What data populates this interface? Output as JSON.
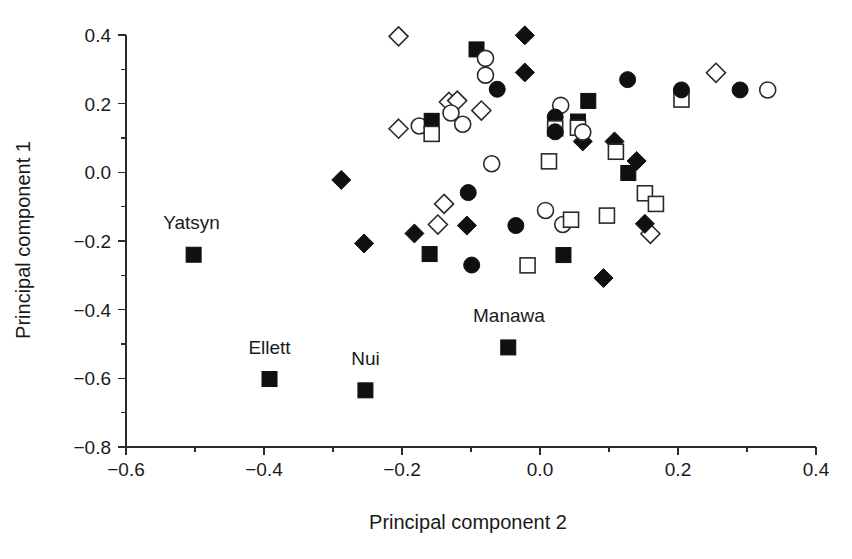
{
  "chart_data": {
    "type": "scatter",
    "title": "",
    "xlabel": "Principal component 2",
    "ylabel": "Principal component 1",
    "xlim": [
      -0.6,
      0.4
    ],
    "ylim": [
      -0.8,
      0.4
    ],
    "xticks": [
      -0.6,
      -0.4,
      -0.2,
      0.0,
      0.2,
      0.4
    ],
    "xticklabels": [
      "−0.6",
      "−0.4",
      "−0.2",
      "0.0",
      "0.2",
      "0.4"
    ],
    "xminorticks": [
      -0.5,
      -0.3,
      -0.1,
      0.1,
      0.3
    ],
    "yticks": [
      -0.8,
      -0.6,
      -0.4,
      -0.2,
      0.0,
      0.2,
      0.4
    ],
    "yticklabels": [
      "−0.8",
      "−0.6",
      "−0.4",
      "−0.2",
      "0.0",
      "0.2",
      "0.4"
    ],
    "yminorticks": [
      -0.7,
      -0.5,
      -0.3,
      -0.1,
      0.1,
      0.3
    ],
    "grid": false,
    "legend": "none",
    "marker_styles": {
      "filled-square": "solid black square",
      "open-square": "white square with black outline",
      "filled-circle": "solid black circle",
      "open-circle": "white circle with black outline",
      "filled-diamond": "solid black diamond",
      "open-diamond": "white diamond with black outline"
    },
    "annotations": [
      {
        "text": "Yatsyn",
        "x": -0.505,
        "y": -0.165
      },
      {
        "text": "Ellett",
        "x": -0.392,
        "y": -0.528
      },
      {
        "text": "Nui",
        "x": -0.253,
        "y": -0.562
      },
      {
        "text": "Manawa",
        "x": -0.045,
        "y": -0.437
      }
    ],
    "points": [
      {
        "x": -0.502,
        "y": -0.24,
        "marker": "filled-square",
        "label": "Yatsyn"
      },
      {
        "x": -0.392,
        "y": -0.602,
        "marker": "filled-square",
        "label": "Ellett"
      },
      {
        "x": -0.253,
        "y": -0.635,
        "marker": "filled-square",
        "label": "Nui"
      },
      {
        "x": -0.046,
        "y": -0.51,
        "marker": "filled-square",
        "label": "Manawa"
      },
      {
        "x": -0.288,
        "y": -0.022,
        "marker": "filled-diamond"
      },
      {
        "x": -0.255,
        "y": -0.207,
        "marker": "filled-diamond"
      },
      {
        "x": -0.182,
        "y": -0.178,
        "marker": "filled-diamond"
      },
      {
        "x": -0.16,
        "y": -0.238,
        "marker": "filled-square"
      },
      {
        "x": -0.148,
        "y": -0.152,
        "marker": "open-diamond"
      },
      {
        "x": -0.139,
        "y": -0.092,
        "marker": "open-diamond"
      },
      {
        "x": -0.104,
        "y": -0.059,
        "marker": "filled-circle"
      },
      {
        "x": -0.099,
        "y": -0.27,
        "marker": "filled-circle"
      },
      {
        "x": -0.106,
        "y": -0.155,
        "marker": "filled-diamond"
      },
      {
        "x": -0.205,
        "y": 0.396,
        "marker": "open-diamond"
      },
      {
        "x": -0.205,
        "y": 0.127,
        "marker": "open-diamond"
      },
      {
        "x": -0.175,
        "y": 0.135,
        "marker": "open-circle"
      },
      {
        "x": -0.157,
        "y": 0.15,
        "marker": "filled-square"
      },
      {
        "x": -0.157,
        "y": 0.112,
        "marker": "open-square"
      },
      {
        "x": -0.132,
        "y": 0.205,
        "marker": "open-diamond"
      },
      {
        "x": -0.12,
        "y": 0.209,
        "marker": "open-diamond"
      },
      {
        "x": -0.129,
        "y": 0.173,
        "marker": "open-circle"
      },
      {
        "x": -0.112,
        "y": 0.14,
        "marker": "open-circle"
      },
      {
        "x": -0.092,
        "y": 0.358,
        "marker": "filled-square"
      },
      {
        "x": -0.079,
        "y": 0.332,
        "marker": "open-circle"
      },
      {
        "x": -0.079,
        "y": 0.283,
        "marker": "open-circle"
      },
      {
        "x": -0.085,
        "y": 0.18,
        "marker": "open-diamond"
      },
      {
        "x": -0.07,
        "y": 0.025,
        "marker": "open-circle"
      },
      {
        "x": -0.062,
        "y": 0.242,
        "marker": "filled-circle"
      },
      {
        "x": -0.022,
        "y": 0.399,
        "marker": "filled-diamond"
      },
      {
        "x": -0.022,
        "y": 0.291,
        "marker": "filled-diamond"
      },
      {
        "x": -0.035,
        "y": -0.155,
        "marker": "filled-circle"
      },
      {
        "x": -0.018,
        "y": -0.271,
        "marker": "open-square"
      },
      {
        "x": 0.008,
        "y": -0.111,
        "marker": "open-circle"
      },
      {
        "x": 0.013,
        "y": 0.032,
        "marker": "open-square"
      },
      {
        "x": 0.03,
        "y": 0.195,
        "marker": "open-circle"
      },
      {
        "x": 0.022,
        "y": 0.161,
        "marker": "filled-circle"
      },
      {
        "x": 0.055,
        "y": 0.148,
        "marker": "filled-square"
      },
      {
        "x": 0.022,
        "y": 0.128,
        "marker": "open-square"
      },
      {
        "x": 0.055,
        "y": 0.13,
        "marker": "open-square"
      },
      {
        "x": 0.022,
        "y": 0.118,
        "marker": "filled-circle"
      },
      {
        "x": 0.062,
        "y": 0.09,
        "marker": "filled-diamond"
      },
      {
        "x": 0.062,
        "y": 0.117,
        "marker": "open-circle"
      },
      {
        "x": 0.033,
        "y": -0.152,
        "marker": "open-circle"
      },
      {
        "x": 0.045,
        "y": -0.138,
        "marker": "open-square"
      },
      {
        "x": 0.034,
        "y": -0.241,
        "marker": "filled-square"
      },
      {
        "x": 0.097,
        "y": -0.126,
        "marker": "open-square"
      },
      {
        "x": 0.108,
        "y": 0.09,
        "marker": "filled-diamond"
      },
      {
        "x": 0.11,
        "y": 0.06,
        "marker": "open-square"
      },
      {
        "x": 0.092,
        "y": -0.308,
        "marker": "filled-diamond"
      },
      {
        "x": 0.07,
        "y": 0.208,
        "marker": "filled-square"
      },
      {
        "x": 0.127,
        "y": 0.27,
        "marker": "filled-circle"
      },
      {
        "x": 0.128,
        "y": -0.002,
        "marker": "filled-square"
      },
      {
        "x": 0.14,
        "y": 0.033,
        "marker": "filled-diamond"
      },
      {
        "x": 0.152,
        "y": -0.061,
        "marker": "open-square"
      },
      {
        "x": 0.168,
        "y": -0.092,
        "marker": "open-square"
      },
      {
        "x": 0.16,
        "y": -0.179,
        "marker": "open-diamond"
      },
      {
        "x": 0.152,
        "y": -0.15,
        "marker": "filled-diamond"
      },
      {
        "x": 0.205,
        "y": 0.212,
        "marker": "open-square"
      },
      {
        "x": 0.205,
        "y": 0.24,
        "marker": "filled-circle"
      },
      {
        "x": 0.255,
        "y": 0.29,
        "marker": "open-diamond"
      },
      {
        "x": 0.33,
        "y": 0.24,
        "marker": "open-circle"
      },
      {
        "x": 0.29,
        "y": 0.24,
        "marker": "filled-circle"
      }
    ]
  }
}
